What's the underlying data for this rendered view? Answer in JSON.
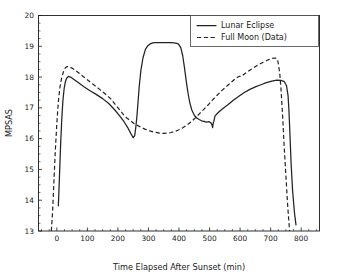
{
  "figure": {
    "width": 338,
    "height": 278,
    "background": "#ffffff",
    "foreground": "#1a1a1a"
  },
  "chart_data": {
    "type": "line",
    "title": "",
    "xlabel": "Time Elapsed After Sunset (min)",
    "ylabel": "MPSAS",
    "xlim": [
      -60,
      860
    ],
    "ylim": [
      13,
      20
    ],
    "xticks": [
      0,
      100,
      200,
      300,
      400,
      500,
      600,
      700,
      800
    ],
    "yticks": [
      13,
      14,
      15,
      16,
      17,
      18,
      19,
      20
    ],
    "xtick_labels": [
      "0",
      "100",
      "200",
      "300",
      "400",
      "500",
      "600",
      "700",
      "800"
    ],
    "ytick_labels": [
      "13",
      "14",
      "15",
      "16",
      "17",
      "18",
      "19",
      "20"
    ],
    "grid": false,
    "legend_position": "upper right",
    "legend": [
      "Lunar Eclipse",
      "Full Moon (Data)"
    ],
    "series": [
      {
        "name": "Lunar Eclipse",
        "style": "solid",
        "color": "#222222",
        "x": [
          5,
          8,
          12,
          16,
          20,
          24,
          28,
          32,
          38,
          45,
          55,
          70,
          90,
          110,
          130,
          150,
          170,
          190,
          205,
          220,
          232,
          242,
          250,
          255,
          258,
          262,
          266,
          270,
          275,
          282,
          290,
          298,
          306,
          314,
          322,
          330,
          340,
          355,
          370,
          385,
          398,
          406,
          412,
          418,
          424,
          430,
          436,
          442,
          450,
          458,
          466,
          474,
          482,
          490,
          498,
          504,
          508,
          510,
          512,
          514,
          518,
          524,
          532,
          545,
          560,
          578,
          596,
          614,
          632,
          650,
          668,
          686,
          704,
          720,
          734,
          745,
          752,
          757,
          760,
          763,
          767,
          772,
          778,
          783
        ],
        "y": [
          13.82,
          14.6,
          15.7,
          16.6,
          17.25,
          17.63,
          17.85,
          17.96,
          18.02,
          18.0,
          17.93,
          17.82,
          17.68,
          17.55,
          17.43,
          17.3,
          17.14,
          16.93,
          16.75,
          16.55,
          16.36,
          16.17,
          16.03,
          16.1,
          16.32,
          16.7,
          17.2,
          17.72,
          18.2,
          18.62,
          18.9,
          19.02,
          19.08,
          19.11,
          19.12,
          19.12,
          19.12,
          19.12,
          19.12,
          19.11,
          19.08,
          18.95,
          18.7,
          18.3,
          17.85,
          17.45,
          17.14,
          16.93,
          16.76,
          16.67,
          16.62,
          16.58,
          16.56,
          16.54,
          16.55,
          16.52,
          16.45,
          16.36,
          16.5,
          16.56,
          16.74,
          16.8,
          16.88,
          16.99,
          17.1,
          17.25,
          17.38,
          17.5,
          17.6,
          17.68,
          17.75,
          17.82,
          17.87,
          17.9,
          17.89,
          17.85,
          17.72,
          17.4,
          16.9,
          16.2,
          15.2,
          14.3,
          13.6,
          13.2
        ]
      },
      {
        "name": "Full Moon (Data)",
        "style": "dashed",
        "color": "#222222",
        "x": [
          -18,
          -14,
          -10,
          -5,
          0,
          5,
          10,
          16,
          22,
          28,
          34,
          40,
          48,
          58,
          70,
          86,
          104,
          122,
          140,
          158,
          176,
          192,
          206,
          218,
          228,
          236,
          244,
          252,
          262,
          274,
          288,
          304,
          320,
          336,
          350,
          362,
          374,
          386,
          398,
          412,
          426,
          440,
          454,
          468,
          482,
          496,
          510,
          524,
          540,
          556,
          572,
          586,
          596,
          604,
          614,
          628,
          644,
          660,
          676,
          692,
          706,
          716,
          722,
          726,
          730,
          734,
          739,
          744,
          750,
          756,
          762
        ],
        "y": [
          13.0,
          13.6,
          14.5,
          15.6,
          16.5,
          17.2,
          17.65,
          17.98,
          18.18,
          18.3,
          18.34,
          18.34,
          18.3,
          18.24,
          18.15,
          18.02,
          17.88,
          17.74,
          17.6,
          17.46,
          17.3,
          17.1,
          16.93,
          16.78,
          16.68,
          16.62,
          16.56,
          16.5,
          16.44,
          16.38,
          16.31,
          16.25,
          16.21,
          16.18,
          16.17,
          16.18,
          16.2,
          16.23,
          16.28,
          16.35,
          16.44,
          16.55,
          16.68,
          16.82,
          16.96,
          17.1,
          17.26,
          17.4,
          17.56,
          17.7,
          17.84,
          17.96,
          18.02,
          18.02,
          18.1,
          18.2,
          18.3,
          18.4,
          18.48,
          18.56,
          18.61,
          18.62,
          18.58,
          18.4,
          18.1,
          17.6,
          16.8,
          15.8,
          14.8,
          13.8,
          13.0
        ]
      }
    ]
  }
}
